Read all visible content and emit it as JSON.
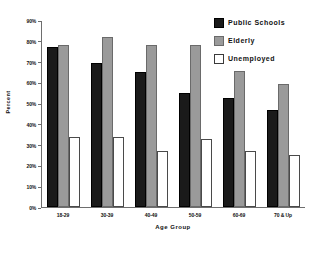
{
  "chart_data": {
    "type": "bar",
    "title": "",
    "xlabel": "Age Group",
    "ylabel": "Percent",
    "categories": [
      "18-29",
      "30-39",
      "40-49",
      "50-59",
      "60-69",
      "70 & Up"
    ],
    "series": [
      {
        "name": "Public Schools",
        "color": "#1a1a1a",
        "values": [
          77,
          69.5,
          65,
          55,
          52.5,
          46.5
        ]
      },
      {
        "name": "Elderly",
        "color": "#9a9a9a",
        "values": [
          78,
          82,
          78,
          78,
          65.5,
          59
        ]
      },
      {
        "name": "Unemployed",
        "color": "#ffffff",
        "values": [
          33.5,
          33.5,
          27,
          32.5,
          27,
          25
        ]
      }
    ],
    "ylim": [
      0,
      90
    ],
    "ytick_labels": [
      "90%",
      "80%",
      "70%",
      "60%",
      "50%",
      "40%",
      "30%",
      "20%",
      "10%",
      "0%"
    ],
    "ytick_values": [
      90,
      80,
      70,
      60,
      50,
      40,
      30,
      20,
      10,
      0
    ],
    "grid": false,
    "legend_position": "top-right"
  }
}
